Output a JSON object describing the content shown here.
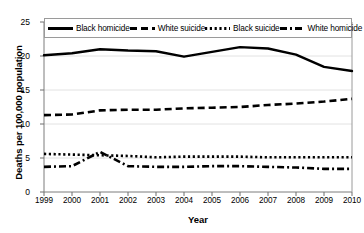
{
  "chart_data": {
    "type": "line",
    "title": "",
    "xlabel": "Year",
    "ylabel": "Deaths per 100,000 population",
    "x": [
      1999,
      2000,
      2001,
      2002,
      2003,
      2004,
      2005,
      2006,
      2007,
      2008,
      2009,
      2010
    ],
    "xlim": [
      1999,
      2010
    ],
    "ylim": [
      0,
      25
    ],
    "yticks": [
      0,
      5,
      10,
      15,
      20,
      25
    ],
    "xticks": [
      "1999",
      "2000",
      "2001",
      "2002",
      "2003",
      "2004",
      "2005",
      "2006",
      "2007",
      "2008",
      "2009",
      "2010"
    ],
    "grid": true,
    "legend_position": "top",
    "series": [
      {
        "name": "Black homicide",
        "style": "solid",
        "color": "#000000",
        "values": [
          20.1,
          20.4,
          21.0,
          20.8,
          20.7,
          19.9,
          20.6,
          21.3,
          21.1,
          20.2,
          18.4,
          17.8
        ]
      },
      {
        "name": "White suicide",
        "style": "dashed",
        "color": "#000000",
        "values": [
          11.3,
          11.4,
          12.0,
          12.1,
          12.1,
          12.3,
          12.4,
          12.5,
          12.8,
          13.0,
          13.3,
          13.7
        ]
      },
      {
        "name": "Black suicide",
        "style": "dotted",
        "color": "#000000",
        "values": [
          5.6,
          5.5,
          5.4,
          5.3,
          5.1,
          5.2,
          5.2,
          5.2,
          5.1,
          5.1,
          5.1,
          5.1
        ]
      },
      {
        "name": "White homicide",
        "style": "dashdot",
        "color": "#000000",
        "values": [
          3.7,
          3.8,
          5.9,
          3.8,
          3.7,
          3.7,
          3.8,
          3.8,
          3.7,
          3.6,
          3.4,
          3.4
        ]
      }
    ]
  },
  "legend": {
    "items": [
      {
        "label": "Black homicide",
        "swatch": "solid-line-swatch"
      },
      {
        "label": "White suicide",
        "swatch": "dashed-line-swatch"
      },
      {
        "label": "Black suicide",
        "swatch": "dotted-line-swatch"
      },
      {
        "label": "White homicide",
        "swatch": "dashdot-line-swatch"
      }
    ]
  },
  "axes": {
    "ylabel": "Deaths per 100,000 population",
    "xlabel": "Year"
  }
}
